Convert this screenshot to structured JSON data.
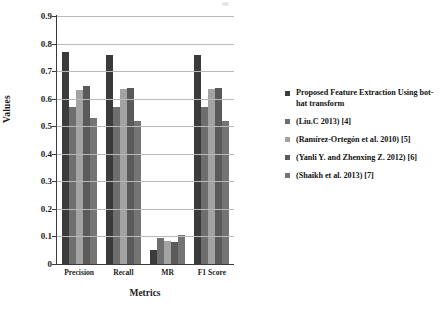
{
  "chart_data": {
    "type": "bar",
    "title": "",
    "subtitle": "",
    "xlabel": "Metrics",
    "ylabel": "Values",
    "categories": [
      "Precision",
      "Recall",
      "MR",
      "F1 Score"
    ],
    "ylim": [
      0,
      0.9
    ],
    "ytick_labels": [
      "0",
      "0.1",
      "0.2",
      "0.3",
      "0.4",
      "0.5",
      "0.6",
      "0.7",
      "0.8",
      "0.9"
    ],
    "ytick_values": [
      0,
      0.1,
      0.2,
      0.3,
      0.4,
      0.5,
      0.6,
      0.7,
      0.8,
      0.9
    ],
    "grid": true,
    "legend_position": "right",
    "series": [
      {
        "name": "Proposed Feature Extraction Using bot-hat transform",
        "color": "#3b3b3b",
        "values": [
          0.77,
          0.76,
          0.05,
          0.76
        ]
      },
      {
        "name": "(Liu.C 2013) [4]",
        "color": "#6e6e6e",
        "values": [
          0.57,
          0.57,
          0.095,
          0.57
        ]
      },
      {
        "name": "(Ramírez-Ortegón et al. 2010) [5]",
        "color": "#a3a3a3",
        "values": [
          0.63,
          0.635,
          0.085,
          0.635
        ]
      },
      {
        "name": "(Yanli Y. and Zhenxing Z. 2012) [6]",
        "color": "#5a5a5a",
        "values": [
          0.645,
          0.64,
          0.08,
          0.64
        ]
      },
      {
        "name": "(Shaikh et al. 2013) [7]",
        "color": "#747474",
        "values": [
          0.53,
          0.52,
          0.105,
          0.52
        ]
      }
    ]
  }
}
